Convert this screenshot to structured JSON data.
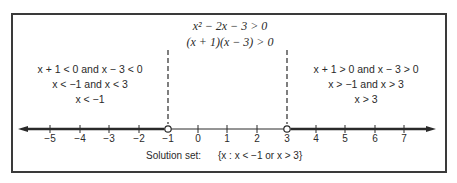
{
  "top": {
    "equation1": "x² − 2x − 3 > 0",
    "equation2": "(x + 1)(x − 3) > 0"
  },
  "left_case": {
    "line1": "x + 1 < 0  and  x − 3 < 0",
    "line2": "x < −1  and  x < 3",
    "line3": "x < −1"
  },
  "right_case": {
    "line1": "x + 1 > 0  and  x − 3 > 0",
    "line2": "x > −1  and  x > 3",
    "line3": "x > 3"
  },
  "number_line": {
    "ticks": [
      "−5",
      "−4",
      "−3",
      "−2",
      "−1",
      "0",
      "1",
      "2",
      "3",
      "4",
      "5",
      "6",
      "7"
    ],
    "open_points": [
      "−1",
      "3"
    ]
  },
  "solution": {
    "label": "Solution set:",
    "set": "{x : x < −1  or  x > 3}"
  },
  "colors": {
    "ink": "#2a2a2a",
    "frame": "#3a3a3a"
  }
}
